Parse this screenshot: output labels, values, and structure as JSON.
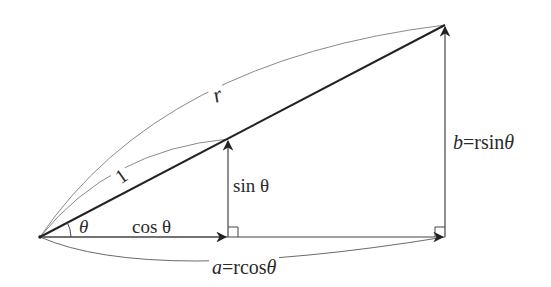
{
  "diagram": {
    "type": "polar-to-rectangular triangle",
    "colors": {
      "line": "#222222",
      "thin_line": "#555555",
      "arc": "#888888",
      "text": "#2a2a2a",
      "background": "#ffffff"
    },
    "points": {
      "origin": [
        40,
        237
      ],
      "unit_tip": [
        228,
        139
      ],
      "unit_foot": [
        228,
        237
      ],
      "r_tip": [
        445,
        25
      ],
      "r_foot": [
        445,
        237
      ]
    },
    "labels": {
      "r": "r",
      "one": "1",
      "theta": "θ",
      "cos": "cos θ",
      "sin": "sin θ",
      "a_var": "a",
      "a_expr": "=rcos",
      "a_theta": "θ",
      "b_var": "b",
      "b_expr": "=rsin",
      "b_theta": "θ"
    }
  }
}
